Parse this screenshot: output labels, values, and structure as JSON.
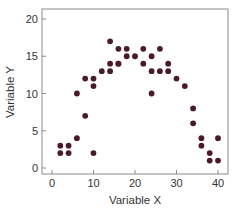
{
  "chart_data": {
    "type": "scatter",
    "title": "",
    "xlabel": "Variable X",
    "ylabel": "Variable Y",
    "xlim": [
      -2,
      42
    ],
    "ylim": [
      -1,
      21
    ],
    "xticks": [
      0,
      10,
      20,
      30,
      40
    ],
    "yticks": [
      0,
      5,
      10,
      15,
      20
    ],
    "grid": false,
    "legend": null,
    "marker_color": "#4a1a2a",
    "series": [
      {
        "name": "data",
        "points": [
          [
            2,
            3
          ],
          [
            4,
            3
          ],
          [
            2,
            2
          ],
          [
            4,
            2
          ],
          [
            6,
            4
          ],
          [
            8,
            7
          ],
          [
            6,
            10
          ],
          [
            10,
            2
          ],
          [
            10,
            11
          ],
          [
            8,
            12
          ],
          [
            10,
            12
          ],
          [
            12,
            13
          ],
          [
            14,
            13
          ],
          [
            14,
            14
          ],
          [
            16,
            14
          ],
          [
            14,
            17
          ],
          [
            16,
            16
          ],
          [
            18,
            16
          ],
          [
            22,
            16
          ],
          [
            26,
            16
          ],
          [
            18,
            15
          ],
          [
            20,
            15
          ],
          [
            24,
            15
          ],
          [
            22,
            14
          ],
          [
            28,
            14
          ],
          [
            24,
            13
          ],
          [
            26,
            13
          ],
          [
            28,
            13
          ],
          [
            30,
            12
          ],
          [
            24,
            10
          ],
          [
            32,
            11
          ],
          [
            34,
            8
          ],
          [
            34,
            6
          ],
          [
            36,
            4
          ],
          [
            40,
            4
          ],
          [
            36,
            3
          ],
          [
            38,
            2
          ],
          [
            38,
            1
          ],
          [
            40,
            1
          ],
          [
            16,
            14
          ]
        ]
      }
    ]
  }
}
